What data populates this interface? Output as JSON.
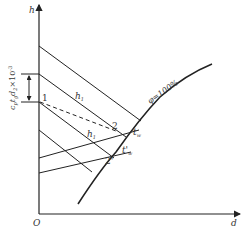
{
  "diagram": {
    "type": "h-d psychrometric chart",
    "axes": {
      "y_label": "h",
      "x_label": "d",
      "origin_label": "O"
    },
    "saturation_curve": {
      "label": "φ=100%"
    },
    "interval_label": "c_p t_g d_2 ×10^-3",
    "interval_label_parts": {
      "main": "c",
      "sub1": "p",
      "t": "t",
      "sub2": "g",
      "d": "d",
      "sub3": "2",
      "times": "×10",
      "exp": "-3"
    },
    "points": [
      {
        "id": "1",
        "label": "1"
      },
      {
        "id": "2",
        "label": "2"
      },
      {
        "id": "2p",
        "label": "2'"
      }
    ],
    "line_labels": {
      "h1_upper": {
        "main": "h",
        "sub": "1"
      },
      "h1_lower": {
        "main": "h",
        "sub": "1"
      },
      "tw": {
        "main": "t",
        "sub": "w"
      },
      "tw_prime": {
        "main": "t'",
        "sub": "w"
      }
    }
  }
}
